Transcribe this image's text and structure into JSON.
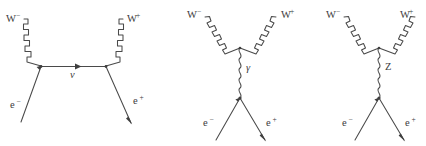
{
  "figure": {
    "background_color": "#ffffff",
    "line_color": "#4a4a4a",
    "label_color": "#3c3c3c"
  },
  "diagrams": [
    {
      "id": "t-channel-neutrino-exchange",
      "name": "neutrino-exchange-diagram",
      "mediator_label": "ν",
      "mediator_kind": "fermion-propagator",
      "labels": {
        "top_left": {
          "base": "W",
          "sup": "−"
        },
        "top_right": {
          "base": "W",
          "sup": "+"
        },
        "bottom_left": {
          "base": "e",
          "sup": "−"
        },
        "bottom_right": {
          "base": "e",
          "sup": "+"
        }
      }
    },
    {
      "id": "s-channel-photon-exchange",
      "name": "photon-exchange-diagram",
      "mediator_label": "γ",
      "mediator_kind": "wavy-propagator",
      "labels": {
        "top_left": {
          "base": "W",
          "sup": "−"
        },
        "top_right": {
          "base": "W",
          "sup": "+"
        },
        "bottom_left": {
          "base": "e",
          "sup": "−"
        },
        "bottom_right": {
          "base": "e",
          "sup": "+"
        }
      }
    },
    {
      "id": "s-channel-z-exchange",
      "name": "z-boson-exchange-diagram",
      "mediator_label": "Z",
      "mediator_kind": "wavy-propagator",
      "labels": {
        "top_left": {
          "base": "W",
          "sup": "−"
        },
        "top_right": {
          "base": "W",
          "sup": "+"
        },
        "bottom_left": {
          "base": "e",
          "sup": "−"
        },
        "bottom_right": {
          "base": "e",
          "sup": "+"
        }
      }
    }
  ]
}
